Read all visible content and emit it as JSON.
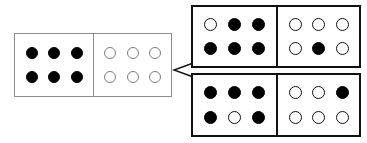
{
  "figure": {
    "background_color": "#ffffff",
    "source_border_color": "#8d8d8d",
    "option_border_color": "#111111",
    "pip_filled_color": "#000000",
    "pip_open_color": "#ffffff",
    "connector_color": "#111111",
    "connector_shape": "less-than-bracket"
  },
  "dominoes": [
    {
      "id": "source-domino",
      "role": "source",
      "position": {
        "x": 14,
        "y": 33,
        "width": 158,
        "height": 64
      },
      "halves": [
        {
          "id": "source-left-half",
          "filled_count": 6,
          "open_count": 0,
          "rows": [
            [
              "filled",
              "filled",
              "filled"
            ],
            [
              "filled",
              "filled",
              "filled"
            ]
          ]
        },
        {
          "id": "source-right-half",
          "filled_count": 0,
          "open_count": 6,
          "rows": [
            [
              "open",
              "open",
              "open"
            ],
            [
              "open",
              "open",
              "open"
            ]
          ]
        }
      ]
    },
    {
      "id": "option-domino-top",
      "role": "option",
      "position": {
        "x": 191,
        "y": 5,
        "width": 170,
        "height": 63
      },
      "halves": [
        {
          "id": "option-top-left-half",
          "filled_count": 5,
          "open_count": 1,
          "rows": [
            [
              "open",
              "filled",
              "filled"
            ],
            [
              "filled",
              "filled",
              "filled"
            ]
          ]
        },
        {
          "id": "option-top-right-half",
          "filled_count": 1,
          "open_count": 5,
          "rows": [
            [
              "open",
              "open",
              "open"
            ],
            [
              "open",
              "filled",
              "open"
            ]
          ]
        }
      ]
    },
    {
      "id": "option-domino-bottom",
      "role": "option",
      "position": {
        "x": 191,
        "y": 73,
        "width": 170,
        "height": 64
      },
      "halves": [
        {
          "id": "option-bottom-left-half",
          "filled_count": 5,
          "open_count": 1,
          "rows": [
            [
              "filled",
              "filled",
              "filled"
            ],
            [
              "filled",
              "open",
              "filled"
            ]
          ]
        },
        {
          "id": "option-bottom-right-half",
          "filled_count": 1,
          "open_count": 5,
          "rows": [
            [
              "open",
              "open",
              "filled"
            ],
            [
              "open",
              "open",
              "open"
            ]
          ]
        }
      ]
    }
  ]
}
